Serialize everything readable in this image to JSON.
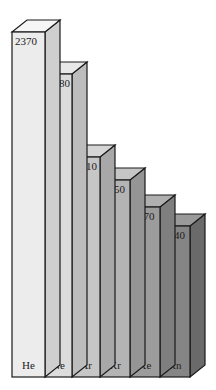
{
  "chart_data": {
    "type": "bar",
    "style": "3d",
    "title": "",
    "xlabel": "",
    "ylabel": "",
    "categories": [
      "He",
      "Ne",
      "Ar",
      "Kr",
      "Xe",
      "Rn"
    ],
    "values": [
      2370,
      2080,
      1510,
      1350,
      1170,
      1040
    ],
    "data_labels": [
      "2370",
      "2080",
      "1510",
      "1350",
      "1170",
      "1040"
    ],
    "grid": false,
    "legend": null,
    "colors": {
      "front": [
        "#ececec",
        "#dcdcdc",
        "#c6c6c6",
        "#b4b4b4",
        "#9c9c9c",
        "#858585"
      ],
      "side": [
        "#cfcfcf",
        "#bdbdbd",
        "#a8a8a8",
        "#959595",
        "#7f7f7f",
        "#6a6a6a"
      ],
      "top": [
        "#f6f6f6",
        "#e8e8e8",
        "#d6d6d6",
        "#c6c6c6",
        "#b0b0b0",
        "#9a9a9a"
      ],
      "outline": "#1a1a1a"
    }
  }
}
